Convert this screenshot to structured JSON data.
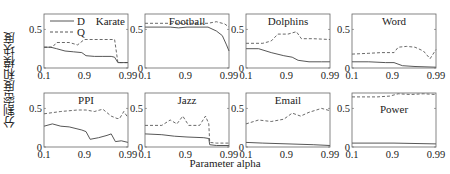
{
  "figure": {
    "ylabel": "分割密度和模块度",
    "xlabel": "Parameter alpha",
    "legend": [
      {
        "label": "D",
        "style": "solid"
      },
      {
        "label": "Q",
        "style": "dashed"
      }
    ]
  },
  "chart_data": [
    {
      "type": "line",
      "title": "Karate",
      "x_ticks": [
        "0.1",
        "0.9",
        "0.99"
      ],
      "y_ticks": [
        "0",
        "0.5"
      ],
      "ylim": [
        0,
        0.7
      ],
      "legend": [
        "D",
        "Q"
      ],
      "series": [
        {
          "name": "D",
          "points": [
            [
              0,
              0.27
            ],
            [
              0.08,
              0.27
            ],
            [
              0.15,
              0.25
            ],
            [
              0.25,
              0.22
            ],
            [
              0.35,
              0.21
            ],
            [
              0.45,
              0.2
            ],
            [
              0.5,
              0.16
            ],
            [
              0.6,
              0.15
            ],
            [
              0.7,
              0.15
            ],
            [
              0.8,
              0.15
            ],
            [
              0.84,
              0.14
            ],
            [
              0.88,
              0.07
            ],
            [
              0.92,
              0.07
            ],
            [
              1,
              0.07
            ]
          ]
        },
        {
          "name": "Q",
          "points": [
            [
              0,
              0.27
            ],
            [
              0.1,
              0.27
            ],
            [
              0.15,
              0.33
            ],
            [
              0.3,
              0.33
            ],
            [
              0.4,
              0.3
            ],
            [
              0.48,
              0.37
            ],
            [
              0.6,
              0.37
            ],
            [
              0.75,
              0.37
            ],
            [
              0.84,
              0.37
            ],
            [
              0.88,
              0.07
            ],
            [
              1,
              0.07
            ]
          ]
        }
      ]
    },
    {
      "type": "line",
      "title": "Football",
      "x_ticks": [
        "0.1",
        "0.9",
        "0.99"
      ],
      "y_ticks": [
        "0",
        "0.5"
      ],
      "ylim": [
        0,
        0.7
      ],
      "series": [
        {
          "name": "D",
          "points": [
            [
              0,
              0.53
            ],
            [
              0.3,
              0.53
            ],
            [
              0.4,
              0.52
            ],
            [
              0.5,
              0.53
            ],
            [
              0.75,
              0.53
            ],
            [
              0.85,
              0.48
            ],
            [
              0.92,
              0.42
            ],
            [
              0.97,
              0.3
            ],
            [
              1,
              0.22
            ]
          ]
        },
        {
          "name": "Q",
          "points": [
            [
              0,
              0.58
            ],
            [
              0.3,
              0.58
            ],
            [
              0.5,
              0.58
            ],
            [
              0.75,
              0.58
            ],
            [
              0.85,
              0.6
            ],
            [
              0.95,
              0.57
            ],
            [
              1,
              0.53
            ]
          ]
        }
      ]
    },
    {
      "type": "line",
      "title": "Dolphins",
      "x_ticks": [
        "0.1",
        "0.9",
        "0.99"
      ],
      "y_ticks": [
        "0",
        "0.5"
      ],
      "ylim": [
        0,
        0.7
      ],
      "series": [
        {
          "name": "D",
          "points": [
            [
              0,
              0.25
            ],
            [
              0.15,
              0.25
            ],
            [
              0.3,
              0.2
            ],
            [
              0.45,
              0.16
            ],
            [
              0.55,
              0.14
            ],
            [
              0.62,
              0.1
            ],
            [
              0.75,
              0.08
            ],
            [
              0.9,
              0.08
            ],
            [
              1,
              0.08
            ]
          ]
        },
        {
          "name": "Q",
          "points": [
            [
              0,
              0.32
            ],
            [
              0.2,
              0.32
            ],
            [
              0.3,
              0.35
            ],
            [
              0.38,
              0.44
            ],
            [
              0.5,
              0.44
            ],
            [
              0.6,
              0.47
            ],
            [
              0.66,
              0.38
            ],
            [
              0.8,
              0.38
            ],
            [
              1,
              0.37
            ]
          ]
        }
      ]
    },
    {
      "type": "line",
      "title": "Word",
      "x_ticks": [
        "0.1",
        "0.9",
        "0.99"
      ],
      "y_ticks": [
        "0",
        "0.5"
      ],
      "ylim": [
        0,
        0.7
      ],
      "series": [
        {
          "name": "D",
          "points": [
            [
              0,
              0.08
            ],
            [
              0.2,
              0.08
            ],
            [
              0.4,
              0.07
            ],
            [
              0.5,
              0.07
            ],
            [
              0.6,
              0.03
            ],
            [
              0.75,
              0.02
            ],
            [
              1,
              0.01
            ]
          ]
        },
        {
          "name": "Q",
          "points": [
            [
              0,
              0.18
            ],
            [
              0.2,
              0.19
            ],
            [
              0.35,
              0.2
            ],
            [
              0.5,
              0.2
            ],
            [
              0.55,
              0.27
            ],
            [
              0.65,
              0.28
            ],
            [
              0.75,
              0.27
            ],
            [
              0.85,
              0.22
            ],
            [
              0.93,
              0.12
            ],
            [
              1,
              0.24
            ]
          ]
        }
      ]
    },
    {
      "type": "line",
      "title": "PPI",
      "x_ticks": [
        "0.1",
        "0.9",
        "0.99"
      ],
      "y_ticks": [
        "0",
        "0.5"
      ],
      "ylim": [
        0,
        0.7
      ],
      "series": [
        {
          "name": "D",
          "points": [
            [
              0,
              0.27
            ],
            [
              0.1,
              0.3
            ],
            [
              0.2,
              0.27
            ],
            [
              0.3,
              0.26
            ],
            [
              0.45,
              0.22
            ],
            [
              0.5,
              0.2
            ],
            [
              0.55,
              0.1
            ],
            [
              0.65,
              0.12
            ],
            [
              0.75,
              0.15
            ],
            [
              0.8,
              0.17
            ],
            [
              0.85,
              0.07
            ],
            [
              0.92,
              0.08
            ],
            [
              1,
              0.06
            ]
          ]
        },
        {
          "name": "Q",
          "points": [
            [
              0,
              0.43
            ],
            [
              0.2,
              0.46
            ],
            [
              0.4,
              0.48
            ],
            [
              0.5,
              0.48
            ],
            [
              0.6,
              0.46
            ],
            [
              0.7,
              0.49
            ],
            [
              0.8,
              0.4
            ],
            [
              0.87,
              0.37
            ],
            [
              0.9,
              0.37
            ],
            [
              0.95,
              0.46
            ],
            [
              1,
              0.38
            ]
          ]
        }
      ]
    },
    {
      "type": "line",
      "title": "Jazz",
      "x_ticks": [
        "0.1",
        "0.9",
        "0.99"
      ],
      "y_ticks": [
        "0",
        "0.5"
      ],
      "ylim": [
        0,
        0.7
      ],
      "series": [
        {
          "name": "D",
          "points": [
            [
              0,
              0.17
            ],
            [
              0.2,
              0.16
            ],
            [
              0.35,
              0.14
            ],
            [
              0.5,
              0.13
            ],
            [
              0.7,
              0.12
            ],
            [
              0.76,
              0.11
            ],
            [
              0.77,
              0.03
            ],
            [
              0.85,
              0.02
            ],
            [
              1,
              0.02
            ]
          ]
        },
        {
          "name": "Q",
          "points": [
            [
              0,
              0.28
            ],
            [
              0.2,
              0.28
            ],
            [
              0.3,
              0.35
            ],
            [
              0.38,
              0.3
            ],
            [
              0.45,
              0.4
            ],
            [
              0.52,
              0.28
            ],
            [
              0.65,
              0.28
            ],
            [
              0.72,
              0.4
            ],
            [
              0.76,
              0.3
            ],
            [
              0.77,
              0.06
            ],
            [
              0.85,
              0.05
            ],
            [
              1,
              0.05
            ]
          ]
        }
      ]
    },
    {
      "type": "line",
      "title": "Email",
      "x_ticks": [
        "0.1",
        "0.9",
        "0.99"
      ],
      "y_ticks": [
        "0",
        "0.5"
      ],
      "ylim": [
        0,
        0.7
      ],
      "series": [
        {
          "name": "D",
          "points": [
            [
              0,
              0.06
            ],
            [
              0.2,
              0.05
            ],
            [
              0.5,
              0.04
            ],
            [
              0.8,
              0.03
            ],
            [
              1,
              0.02
            ]
          ]
        },
        {
          "name": "Q",
          "points": [
            [
              0,
              0.3
            ],
            [
              0.15,
              0.35
            ],
            [
              0.3,
              0.33
            ],
            [
              0.45,
              0.36
            ],
            [
              0.55,
              0.44
            ],
            [
              0.65,
              0.4
            ],
            [
              0.75,
              0.45
            ],
            [
              0.9,
              0.5
            ],
            [
              1,
              0.47
            ]
          ]
        }
      ]
    },
    {
      "type": "line",
      "title": "Power",
      "x_ticks": [
        "0.1",
        "0.9",
        "0.99"
      ],
      "y_ticks": [
        "0",
        "0.5"
      ],
      "ylim": [
        0,
        0.7
      ],
      "series": [
        {
          "name": "D",
          "points": [
            [
              0,
              0.05
            ],
            [
              0.5,
              0.05
            ],
            [
              1,
              0.04
            ]
          ]
        },
        {
          "name": "Q",
          "points": [
            [
              0,
              0.65
            ],
            [
              0.3,
              0.65
            ],
            [
              0.45,
              0.66
            ],
            [
              0.55,
              0.69
            ],
            [
              0.7,
              0.68
            ],
            [
              0.85,
              0.69
            ],
            [
              1,
              0.68
            ]
          ]
        }
      ]
    }
  ]
}
